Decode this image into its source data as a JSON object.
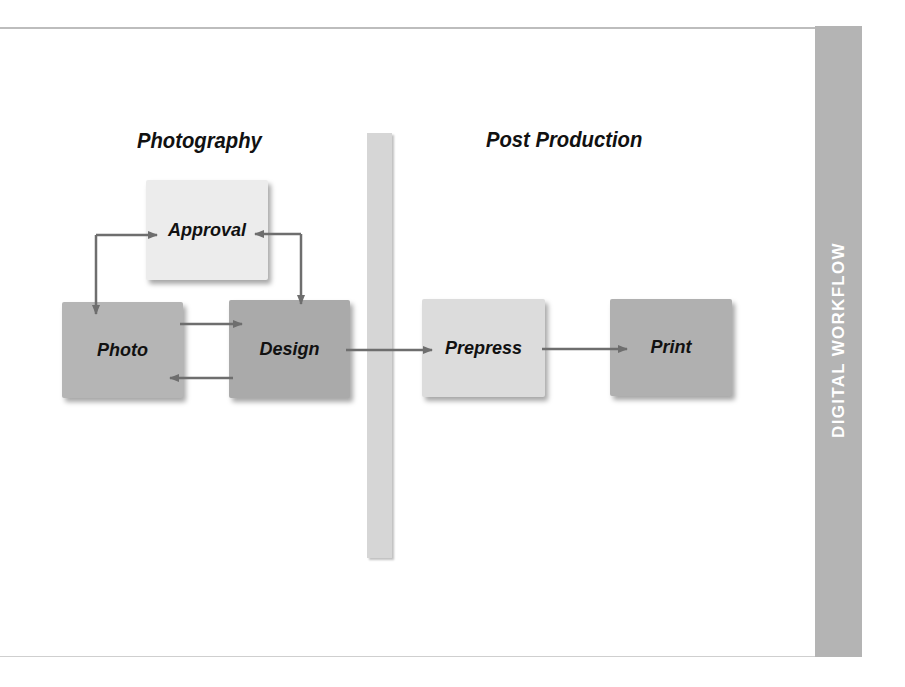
{
  "diagram": {
    "side_label": "DIGITAL WORKFLOW",
    "sections": [
      {
        "id": "photography",
        "title": "Photography"
      },
      {
        "id": "post-production",
        "title": "Post Production"
      }
    ],
    "nodes": [
      {
        "id": "approval",
        "label": "Approval",
        "color": "#ececec"
      },
      {
        "id": "photo",
        "label": "Photo",
        "color": "#b5b5b5"
      },
      {
        "id": "design",
        "label": "Design",
        "color": "#aaaaaa"
      },
      {
        "id": "prepress",
        "label": "Prepress",
        "color": "#dcdcdc"
      },
      {
        "id": "print",
        "label": "Print",
        "color": "#b0b0b0"
      }
    ],
    "edges": [
      {
        "from": "photo",
        "to": "approval",
        "bidirectional": true
      },
      {
        "from": "design",
        "to": "approval",
        "bidirectional": true
      },
      {
        "from": "photo",
        "to": "design"
      },
      {
        "from": "design",
        "to": "photo"
      },
      {
        "from": "design",
        "to": "prepress"
      },
      {
        "from": "prepress",
        "to": "print"
      }
    ],
    "colors": {
      "arrow": "#6e6e6e",
      "side_band": "#b4b4b4",
      "divider": "#d6d6d6"
    }
  }
}
